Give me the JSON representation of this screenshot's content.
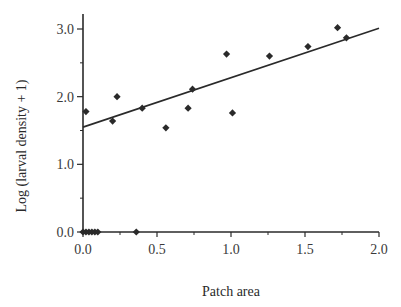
{
  "chart_data": {
    "type": "scatter",
    "title": "",
    "xlabel": "Patch area",
    "ylabel": "Log (larval density + 1)",
    "xlim": [
      0,
      2.0
    ],
    "ylim": [
      0,
      3.0
    ],
    "x_ticks": [
      {
        "value": 0.0,
        "label": "0.0"
      },
      {
        "value": 0.5,
        "label": "0.5"
      },
      {
        "value": 1.0,
        "label": "1.0"
      },
      {
        "value": 1.5,
        "label": "1.5"
      },
      {
        "value": 2.0,
        "label": "2.0"
      }
    ],
    "x_minor_ticks": [
      0.25,
      0.75,
      1.25,
      1.75
    ],
    "y_ticks": [
      {
        "value": 0.0,
        "label": "0.0"
      },
      {
        "value": 1.0,
        "label": "1.0"
      },
      {
        "value": 2.0,
        "label": "2.0"
      },
      {
        "value": 3.0,
        "label": "3.0"
      }
    ],
    "y_minor_ticks": [
      0.5,
      1.5,
      2.5
    ],
    "grid": false,
    "legend": null,
    "series": [
      {
        "name": "patches",
        "marker": "diamond",
        "color": "#2a2a2a",
        "points": [
          {
            "x": 0.02,
            "y": 1.78
          },
          {
            "x": 0.2,
            "y": 1.64
          },
          {
            "x": 0.23,
            "y": 2.0
          },
          {
            "x": 0.4,
            "y": 1.83
          },
          {
            "x": 0.56,
            "y": 1.54
          },
          {
            "x": 0.71,
            "y": 1.83
          },
          {
            "x": 0.74,
            "y": 2.11
          },
          {
            "x": 0.97,
            "y": 2.63
          },
          {
            "x": 1.01,
            "y": 1.76
          },
          {
            "x": 1.26,
            "y": 2.6
          },
          {
            "x": 1.52,
            "y": 2.74
          },
          {
            "x": 1.72,
            "y": 3.02
          },
          {
            "x": 1.78,
            "y": 2.87
          },
          {
            "x": 0.0,
            "y": 0.0
          },
          {
            "x": 0.02,
            "y": 0.0
          },
          {
            "x": 0.04,
            "y": 0.0
          },
          {
            "x": 0.06,
            "y": 0.0
          },
          {
            "x": 0.08,
            "y": 0.0
          },
          {
            "x": 0.1,
            "y": 0.0
          },
          {
            "x": 0.36,
            "y": 0.0
          }
        ]
      }
    ],
    "regression_line": {
      "x_start": 0.0,
      "y_start": 1.55,
      "x_end": 2.0,
      "y_end": 3.01,
      "color": "#2a2a2a"
    }
  }
}
